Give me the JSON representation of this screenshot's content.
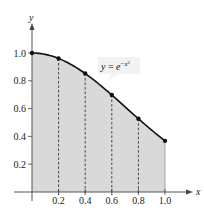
{
  "chart_data": {
    "type": "area",
    "title": "",
    "xlabel": "x",
    "ylabel": "y",
    "function_label": "y = e^(-x^2)",
    "function_label_parts": {
      "lhs": "y",
      "eq": " = ",
      "base": "e",
      "exp_sign": "−",
      "exp_var": "x",
      "exp_pow": "2"
    },
    "x": [
      0,
      0.2,
      0.4,
      0.6,
      0.8,
      1.0
    ],
    "series": [
      {
        "name": "y = e^(-x^2)",
        "values": [
          1.0,
          0.9608,
          0.8521,
          0.6977,
          0.5273,
          0.3679
        ]
      }
    ],
    "xlim": [
      0,
      1.0
    ],
    "ylim": [
      0,
      1.0
    ],
    "x_ticks": [
      "0.2",
      "0.4",
      "0.6",
      "0.8",
      "1.0"
    ],
    "y_ticks": [
      "0.2",
      "0.4",
      "0.6",
      "0.8",
      "1.0"
    ],
    "grid": false,
    "legend": "none",
    "annotations": [
      "Dashed vertical lines at x = 0.2, 0.4, 0.6, 0.8",
      "Shaded region under curve from x = 0 to x = 1"
    ],
    "colors": {
      "fill": "#d9d9d9",
      "curve": "#111111",
      "axis": "#444444",
      "dash": "#333333"
    }
  }
}
